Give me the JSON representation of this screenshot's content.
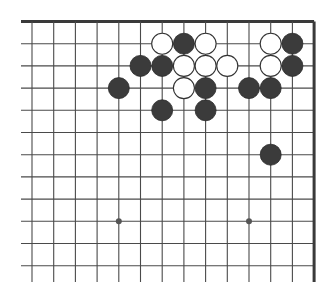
{
  "board": {
    "description": "Go board diagram (upper-right corner section)",
    "visible_columns": 14,
    "visible_rows": 12,
    "edges": {
      "top": true,
      "right": true,
      "left": false,
      "bottom": false
    },
    "colors": {
      "background": "#ffffff",
      "line": "#4a4a4a",
      "border": "#3a3a3a",
      "black_stone": "#3b3b3b",
      "white_stone": "#ffffff",
      "white_outline": "#333333",
      "hoshi": "#555555"
    },
    "hoshi": [
      {
        "col": 4,
        "row": 9
      },
      {
        "col": 10,
        "row": 9
      }
    ],
    "stones": [
      {
        "col": 6,
        "row": 1,
        "color": "white"
      },
      {
        "col": 7,
        "row": 1,
        "color": "black"
      },
      {
        "col": 8,
        "row": 1,
        "color": "white"
      },
      {
        "col": 11,
        "row": 1,
        "color": "white"
      },
      {
        "col": 12,
        "row": 1,
        "color": "black"
      },
      {
        "col": 5,
        "row": 2,
        "color": "black"
      },
      {
        "col": 6,
        "row": 2,
        "color": "black"
      },
      {
        "col": 7,
        "row": 2,
        "color": "white"
      },
      {
        "col": 8,
        "row": 2,
        "color": "white"
      },
      {
        "col": 9,
        "row": 2,
        "color": "white"
      },
      {
        "col": 11,
        "row": 2,
        "color": "white"
      },
      {
        "col": 12,
        "row": 2,
        "color": "black"
      },
      {
        "col": 4,
        "row": 3,
        "color": "black"
      },
      {
        "col": 7,
        "row": 3,
        "color": "white"
      },
      {
        "col": 8,
        "row": 3,
        "color": "black"
      },
      {
        "col": 10,
        "row": 3,
        "color": "black"
      },
      {
        "col": 11,
        "row": 3,
        "color": "black"
      },
      {
        "col": 6,
        "row": 4,
        "color": "black"
      },
      {
        "col": 8,
        "row": 4,
        "color": "black"
      },
      {
        "col": 11,
        "row": 6,
        "color": "black"
      }
    ]
  }
}
